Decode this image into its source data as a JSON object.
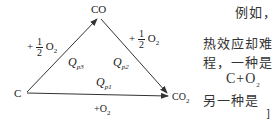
{
  "diagram": {
    "nodes": {
      "c": "C",
      "co": "CO",
      "co2_base": "CO",
      "co2_sub": "2"
    },
    "edges": {
      "left_reagent_sign": "+",
      "left_frac_num": "1",
      "left_frac_den": "2",
      "left_species": "O",
      "left_species_sub": "2",
      "right_reagent_sign": "+",
      "right_frac_num": "1",
      "right_frac_den": "2",
      "right_species": "O",
      "right_species_sub": "2",
      "bottom_reagent": "+O",
      "bottom_reagent_sub": "2"
    },
    "heats": {
      "qp3_base": "Q",
      "qp3_sub": "p3",
      "qp2_base": "Q",
      "qp2_sub": "p2",
      "qp1_base": "Q",
      "qp1_sub": "p1"
    },
    "line_color": "#333333"
  },
  "text": {
    "line1": "例如，(",
    "line2": "热效应却难",
    "line3": "程，一种是",
    "line4_base": "C+O",
    "line4_sub": "2",
    "line5": "另一种是",
    "line6": "]"
  }
}
